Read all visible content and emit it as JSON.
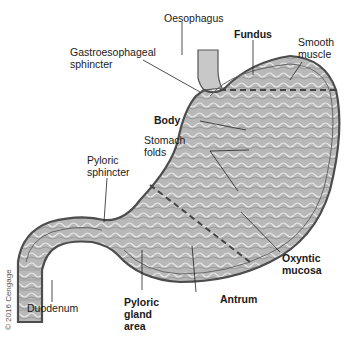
{
  "labels": {
    "oesophagus": "Oesophagus",
    "gastroesophageal_sphincter": "Gastroesophageal\nsphincter",
    "fundus": "Fundus",
    "smooth_muscle": "Smooth\nmuscle",
    "body": "Body",
    "stomach_folds": "Stomach\nfolds",
    "pyloric_sphincter": "Pyloric\nsphincter",
    "oxyntic_mucosa": "Oxyntic\nmucosa",
    "duodenum": "Duodenum",
    "pyloric_gland_area": "Pyloric\ngland\narea",
    "antrum": "Antrum"
  },
  "copyright": "© 2016 Cengage",
  "colors": {
    "stomach_fill": "#b5b5b5",
    "wall": "#555555",
    "dashed": "#444444"
  }
}
